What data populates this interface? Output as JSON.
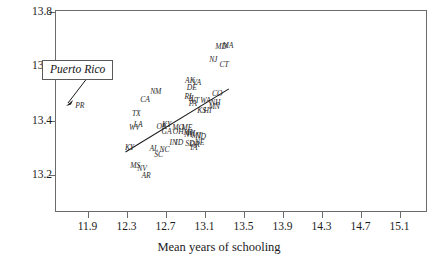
{
  "chart_data": {
    "type": "scatter",
    "title": "",
    "xlabel": "Mean years of schooling",
    "ylabel": "",
    "xlim": [
      11.7,
      15.1
    ],
    "ylim": [
      13.14,
      13.8
    ],
    "grid": false,
    "legend": "none",
    "xticks": [
      "11.9",
      "12.3",
      "12.7",
      "13.1",
      "13.5",
      "13.9",
      "14.3",
      "14.7",
      "15.1"
    ],
    "xtick_values": [
      11.9,
      12.3,
      12.7,
      13.1,
      13.5,
      13.9,
      14.3,
      14.7,
      15.1
    ],
    "yticks": [
      "13.8",
      "13.6",
      "13.4",
      "13.2"
    ],
    "ytick_values": [
      13.8,
      13.6,
      13.4,
      13.2
    ],
    "point_label_style": "state abbreviation text labels",
    "points": [
      {
        "label": "PR",
        "x": 11.82,
        "y": 13.455
      },
      {
        "label": "NM",
        "x": 12.6,
        "y": 13.505
      },
      {
        "label": "CA",
        "x": 12.49,
        "y": 13.475
      },
      {
        "label": "TX",
        "x": 12.4,
        "y": 13.425
      },
      {
        "label": "LA",
        "x": 12.42,
        "y": 13.385
      },
      {
        "label": "WV",
        "x": 12.38,
        "y": 13.372
      },
      {
        "label": "AK",
        "x": 12.95,
        "y": 13.545
      },
      {
        "label": "VA",
        "x": 13.02,
        "y": 13.538
      },
      {
        "label": "DE",
        "x": 12.97,
        "y": 13.522
      },
      {
        "label": "MD",
        "x": 13.27,
        "y": 13.672
      },
      {
        "label": "MA",
        "x": 13.34,
        "y": 13.675
      },
      {
        "label": "NJ",
        "x": 13.19,
        "y": 13.625
      },
      {
        "label": "CT",
        "x": 13.3,
        "y": 13.605
      },
      {
        "label": "RI",
        "x": 12.93,
        "y": 13.487
      },
      {
        "label": "IL",
        "x": 12.97,
        "y": 13.479
      },
      {
        "label": "VT",
        "x": 13.0,
        "y": 13.474
      },
      {
        "label": "PA",
        "x": 12.98,
        "y": 13.462
      },
      {
        "label": "WA",
        "x": 13.11,
        "y": 13.472
      },
      {
        "label": "CO",
        "x": 13.23,
        "y": 13.497
      },
      {
        "label": "NH",
        "x": 13.21,
        "y": 13.466
      },
      {
        "label": "MN",
        "x": 13.2,
        "y": 13.45
      },
      {
        "label": "KS",
        "x": 13.07,
        "y": 13.437
      },
      {
        "label": "HI",
        "x": 13.13,
        "y": 13.437
      },
      {
        "label": "OK",
        "x": 12.66,
        "y": 13.375
      },
      {
        "label": "KY",
        "x": 12.71,
        "y": 13.383
      },
      {
        "label": "MO",
        "x": 12.83,
        "y": 13.374
      },
      {
        "label": "ME",
        "x": 12.92,
        "y": 13.374
      },
      {
        "label": "GA",
        "x": 12.71,
        "y": 13.36
      },
      {
        "label": "OH",
        "x": 12.83,
        "y": 13.358
      },
      {
        "label": "MI",
        "x": 12.93,
        "y": 13.355
      },
      {
        "label": "WI",
        "x": 12.96,
        "y": 13.352
      },
      {
        "label": "NY",
        "x": 12.94,
        "y": 13.348
      },
      {
        "label": "MT",
        "x": 13.02,
        "y": 13.344
      },
      {
        "label": "ND",
        "x": 13.06,
        "y": 13.341
      },
      {
        "label": "IN",
        "x": 12.78,
        "y": 13.318
      },
      {
        "label": "ID",
        "x": 12.84,
        "y": 13.318
      },
      {
        "label": "SD",
        "x": 12.95,
        "y": 13.313
      },
      {
        "label": "OR",
        "x": 13.0,
        "y": 13.312
      },
      {
        "label": "NE",
        "x": 13.05,
        "y": 13.316
      },
      {
        "label": "IA",
        "x": 12.99,
        "y": 13.298
      },
      {
        "label": "KY2",
        "x": 12.33,
        "y": 13.3
      },
      {
        "label": "AL",
        "x": 12.58,
        "y": 13.295
      },
      {
        "label": "NC",
        "x": 12.69,
        "y": 13.292
      },
      {
        "label": "SC",
        "x": 12.63,
        "y": 13.272
      },
      {
        "label": "MS",
        "x": 12.39,
        "y": 13.232
      },
      {
        "label": "NV",
        "x": 12.46,
        "y": 13.222
      },
      {
        "label": "AR",
        "x": 12.5,
        "y": 13.196
      }
    ],
    "fit_line": {
      "x0": 12.29,
      "y0": 13.285,
      "x1": 13.35,
      "y1": 13.517
    },
    "annotations": [
      {
        "text": "Puerto Rico",
        "type": "boxed-callout-with-arrow",
        "points_to": "PR"
      }
    ]
  },
  "axis": {
    "x_title": "Mean years of schooling"
  }
}
